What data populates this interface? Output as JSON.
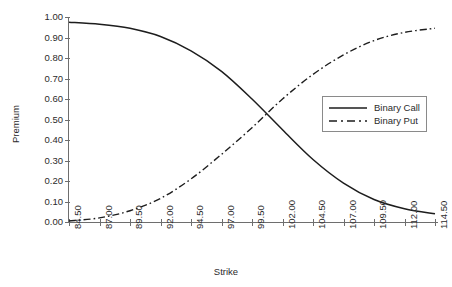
{
  "chart_data": {
    "type": "line",
    "title": "",
    "xlabel": "Strike",
    "ylabel": "Premium",
    "xlim": [
      84.5,
      114.5
    ],
    "ylim": [
      0.0,
      1.0
    ],
    "grid": false,
    "legend_position": "center-right",
    "xtick_labels": [
      "84.50",
      "87.00",
      "89.50",
      "92.00",
      "94.50",
      "97.00",
      "99.50",
      "102.00",
      "104.50",
      "107.00",
      "109.50",
      "112.00",
      "114.50"
    ],
    "ytick_labels": [
      "0.00",
      "0.10",
      "0.20",
      "0.30",
      "0.40",
      "0.50",
      "0.60",
      "0.70",
      "0.80",
      "0.90",
      "1.00"
    ],
    "x": [
      84.5,
      87.0,
      89.5,
      92.0,
      94.5,
      97.0,
      99.5,
      102.0,
      104.5,
      107.0,
      109.5,
      112.0,
      114.5
    ],
    "series": [
      {
        "name": "Binary Call",
        "style": "solid",
        "color": "#1d1d1d",
        "values": [
          0.975,
          0.965,
          0.945,
          0.905,
          0.835,
          0.735,
          0.6,
          0.45,
          0.305,
          0.19,
          0.11,
          0.065,
          0.04
        ]
      },
      {
        "name": "Binary Put",
        "style": "dash-dot",
        "color": "#1d1d1d",
        "values": [
          0.005,
          0.02,
          0.055,
          0.115,
          0.21,
          0.33,
          0.46,
          0.6,
          0.72,
          0.815,
          0.885,
          0.925,
          0.945
        ]
      }
    ],
    "annotations": {
      "crossover_strike": 100.5,
      "crossover_premium": 0.49
    }
  },
  "legend": {
    "items": [
      {
        "label": "Binary Call",
        "icon": "solid-line-swatch"
      },
      {
        "label": "Binary Put",
        "icon": "dash-dot-line-swatch"
      }
    ]
  },
  "axes": {
    "y_title": "Premium",
    "x_title": "Strike"
  },
  "colors": {
    "series": "#1d1d1d",
    "axis": "#6e6e6e",
    "text": "#2b2b2b",
    "background": "#ffffff"
  }
}
